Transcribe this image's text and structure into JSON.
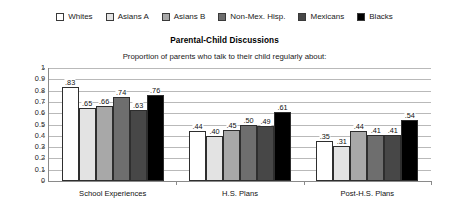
{
  "legend": {
    "entries": [
      {
        "label": "Whites",
        "color": "#ffffff"
      },
      {
        "label": "Asians A",
        "color": "#e3e3e3"
      },
      {
        "label": "Asians B",
        "color": "#a8a8a8"
      },
      {
        "label": "Non-Mex. Hisp.",
        "color": "#6e6e6e"
      },
      {
        "label": "Mexicans",
        "color": "#474747"
      },
      {
        "label": "Blacks",
        "color": "#000000"
      }
    ]
  },
  "chart_data": {
    "type": "bar",
    "title": "Parental-Child Discussions",
    "subtitle": "Proportion of parents who talk to their child regularly about:",
    "xlabel": "",
    "ylabel": "",
    "ylim": [
      0,
      1
    ],
    "ytick_labels": [
      "1",
      "0.9",
      "0.8",
      "0.7",
      "0.6",
      "0.5",
      "0.4",
      "0.3",
      "0.2",
      "0.1",
      "0"
    ],
    "ytick_values": [
      1,
      0.9,
      0.8,
      0.7,
      0.6,
      0.5,
      0.4,
      0.3,
      0.2,
      0.1,
      0
    ],
    "grid": true,
    "legend_position": "top",
    "categories": [
      "School Experiences",
      "H.S. Plans",
      "Post-H.S. Plans"
    ],
    "series": [
      {
        "name": "Whites",
        "color": "#ffffff",
        "values": [
          0.83,
          0.44,
          0.35
        ],
        "labels": [
          ".83",
          ".44",
          ".35"
        ]
      },
      {
        "name": "Asians A",
        "color": "#e3e3e3",
        "values": [
          0.65,
          0.4,
          0.31
        ],
        "labels": [
          ".65",
          ".40",
          ".31"
        ]
      },
      {
        "name": "Asians B",
        "color": "#a8a8a8",
        "values": [
          0.66,
          0.45,
          0.44
        ],
        "labels": [
          ".66",
          ".45",
          ".44"
        ]
      },
      {
        "name": "Non-Mex. Hisp.",
        "color": "#6e6e6e",
        "values": [
          0.74,
          0.5,
          0.41
        ],
        "labels": [
          ".74",
          ".50",
          ".41"
        ]
      },
      {
        "name": "Mexicans",
        "color": "#474747",
        "values": [
          0.63,
          0.49,
          0.41
        ],
        "labels": [
          ".63",
          ".49",
          ".41"
        ]
      },
      {
        "name": "Blacks",
        "color": "#000000",
        "values": [
          0.76,
          0.61,
          0.54
        ],
        "labels": [
          ".76",
          ".61",
          ".54"
        ]
      }
    ]
  }
}
